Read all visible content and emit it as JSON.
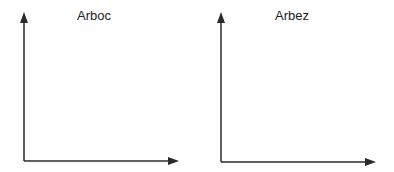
{
  "panels": [
    {
      "title": "Arboc",
      "axes": {
        "origin": [
          24,
          161
        ],
        "y_tip": [
          24,
          12
        ],
        "x_tip": [
          179,
          161
        ]
      },
      "title_pos": [
        77,
        9
      ]
    },
    {
      "title": "Arbez",
      "axes": {
        "origin": [
          221,
          162
        ],
        "y_tip": [
          221,
          12
        ],
        "x_tip": [
          376,
          162
        ]
      },
      "title_pos": [
        275,
        9
      ]
    }
  ],
  "colors": {
    "axis": "#2a2a2a",
    "text": "#222222",
    "background": "#ffffff"
  }
}
